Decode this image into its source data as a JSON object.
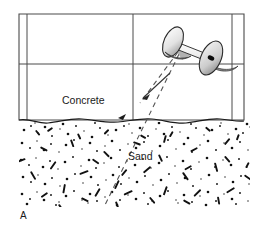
{
  "figure": {
    "panel_label": "A",
    "labels": {
      "concrete": "Concrete",
      "sand": "Sand"
    },
    "colors": {
      "line": "#4a4a4a",
      "outline": "#2b2b2b",
      "text": "#1a1a1a",
      "background": "#ffffff",
      "grain": "#111111",
      "disc_shadow": "#9a9a9a",
      "disc_face": "#ffffff",
      "rod": "#f2f2f2"
    },
    "elements": {
      "concrete_block_name": "concrete-slab",
      "sand_layer_name": "sand-layer",
      "device_name": "dual-antenna-transducer",
      "ray_incident_name": "incident-ray",
      "ray_reflected_name": "reflected-ray",
      "ray_transmitted_name": "transmitted-ray"
    },
    "geometry": {
      "block_left": 19,
      "block_right": 244,
      "block_top": 14,
      "block_bottom": 120,
      "inner_left_line_x": 27,
      "inner_right_line_x": 232,
      "mid_vertical_x": 133,
      "mid_horizontal_y": 64,
      "sand_top": 120,
      "sand_bottom": 207
    }
  },
  "sand_grains": {
    "dots": [
      [
        24,
        130
      ],
      [
        31,
        126
      ],
      [
        38,
        133
      ],
      [
        45,
        127
      ],
      [
        52,
        136
      ],
      [
        60,
        129
      ],
      [
        68,
        134
      ],
      [
        76,
        126
      ],
      [
        84,
        131
      ],
      [
        92,
        137
      ],
      [
        100,
        128
      ],
      [
        108,
        135
      ],
      [
        116,
        130
      ],
      [
        124,
        126
      ],
      [
        132,
        133
      ],
      [
        140,
        128
      ],
      [
        148,
        136
      ],
      [
        156,
        129
      ],
      [
        164,
        134
      ],
      [
        172,
        127
      ],
      [
        180,
        132
      ],
      [
        188,
        138
      ],
      [
        196,
        128
      ],
      [
        204,
        135
      ],
      [
        212,
        130
      ],
      [
        220,
        126
      ],
      [
        228,
        134
      ],
      [
        236,
        129
      ],
      [
        243,
        133
      ],
      [
        250,
        127
      ],
      [
        22,
        143
      ],
      [
        30,
        148
      ],
      [
        37,
        141
      ],
      [
        44,
        150
      ],
      [
        51,
        144
      ],
      [
        59,
        152
      ],
      [
        66,
        145
      ],
      [
        74,
        140
      ],
      [
        82,
        149
      ],
      [
        90,
        143
      ],
      [
        97,
        151
      ],
      [
        105,
        146
      ],
      [
        112,
        141
      ],
      [
        120,
        150
      ],
      [
        128,
        144
      ],
      [
        136,
        148
      ],
      [
        144,
        142
      ],
      [
        152,
        151
      ],
      [
        160,
        146
      ],
      [
        168,
        140
      ],
      [
        176,
        149
      ],
      [
        184,
        144
      ],
      [
        192,
        152
      ],
      [
        200,
        145
      ],
      [
        208,
        141
      ],
      [
        216,
        150
      ],
      [
        224,
        143
      ],
      [
        232,
        148
      ],
      [
        240,
        142
      ],
      [
        248,
        150
      ],
      [
        21,
        160
      ],
      [
        29,
        165
      ],
      [
        36,
        158
      ],
      [
        43,
        167
      ],
      [
        50,
        161
      ],
      [
        58,
        169
      ],
      [
        65,
        162
      ],
      [
        73,
        157
      ],
      [
        81,
        166
      ],
      [
        89,
        160
      ],
      [
        96,
        168
      ],
      [
        104,
        163
      ],
      [
        111,
        158
      ],
      [
        119,
        167
      ],
      [
        127,
        161
      ],
      [
        135,
        165
      ],
      [
        143,
        159
      ],
      [
        151,
        168
      ],
      [
        159,
        163
      ],
      [
        167,
        157
      ],
      [
        175,
        166
      ],
      [
        183,
        161
      ],
      [
        191,
        169
      ],
      [
        199,
        162
      ],
      [
        207,
        158
      ],
      [
        215,
        167
      ],
      [
        223,
        160
      ],
      [
        231,
        165
      ],
      [
        239,
        159
      ],
      [
        247,
        167
      ],
      [
        23,
        177
      ],
      [
        31,
        182
      ],
      [
        38,
        175
      ],
      [
        45,
        184
      ],
      [
        52,
        178
      ],
      [
        60,
        186
      ],
      [
        67,
        179
      ],
      [
        75,
        174
      ],
      [
        83,
        183
      ],
      [
        91,
        177
      ],
      [
        98,
        185
      ],
      [
        106,
        180
      ],
      [
        113,
        175
      ],
      [
        121,
        184
      ],
      [
        129,
        178
      ],
      [
        137,
        182
      ],
      [
        145,
        176
      ],
      [
        153,
        185
      ],
      [
        161,
        180
      ],
      [
        169,
        174
      ],
      [
        177,
        183
      ],
      [
        185,
        178
      ],
      [
        193,
        186
      ],
      [
        201,
        179
      ],
      [
        209,
        175
      ],
      [
        217,
        184
      ],
      [
        225,
        177
      ],
      [
        233,
        182
      ],
      [
        241,
        176
      ],
      [
        249,
        184
      ],
      [
        22,
        194
      ],
      [
        30,
        199
      ],
      [
        37,
        192
      ],
      [
        44,
        200
      ],
      [
        51,
        195
      ],
      [
        59,
        202
      ],
      [
        66,
        196
      ],
      [
        74,
        191
      ],
      [
        82,
        200
      ],
      [
        90,
        194
      ],
      [
        97,
        201
      ],
      [
        105,
        197
      ],
      [
        112,
        192
      ],
      [
        120,
        200
      ],
      [
        128,
        195
      ],
      [
        136,
        199
      ],
      [
        144,
        193
      ],
      [
        152,
        201
      ],
      [
        160,
        196
      ],
      [
        168,
        191
      ],
      [
        176,
        200
      ],
      [
        184,
        195
      ],
      [
        192,
        202
      ],
      [
        200,
        196
      ],
      [
        208,
        192
      ],
      [
        216,
        201
      ],
      [
        224,
        194
      ],
      [
        232,
        199
      ],
      [
        240,
        193
      ],
      [
        248,
        201
      ],
      [
        27,
        204
      ],
      [
        56,
        205
      ],
      [
        88,
        203
      ],
      [
        117,
        205
      ],
      [
        148,
        204
      ],
      [
        178,
        203
      ],
      [
        206,
        205
      ],
      [
        236,
        204
      ],
      [
        35,
        123
      ],
      [
        63,
        124
      ],
      [
        95,
        123
      ],
      [
        129,
        124
      ],
      [
        159,
        123
      ],
      [
        191,
        124
      ],
      [
        221,
        123
      ],
      [
        247,
        124
      ]
    ],
    "streaks": [
      [
        40,
        148,
        5,
        -62
      ],
      [
        55,
        161,
        6,
        35
      ],
      [
        70,
        140,
        5,
        -20
      ],
      [
        88,
        170,
        6,
        70
      ],
      [
        103,
        152,
        5,
        -45
      ],
      [
        118,
        180,
        6,
        25
      ],
      [
        133,
        143,
        5,
        -70
      ],
      [
        150,
        166,
        6,
        50
      ],
      [
        165,
        135,
        5,
        15
      ],
      [
        182,
        173,
        6,
        -35
      ],
      [
        197,
        147,
        5,
        62
      ],
      [
        214,
        163,
        6,
        -15
      ],
      [
        229,
        138,
        5,
        40
      ],
      [
        244,
        176,
        5,
        -55
      ],
      [
        30,
        172,
        6,
        -30
      ],
      [
        47,
        192,
        5,
        55
      ],
      [
        64,
        184,
        6,
        10
      ],
      [
        81,
        199,
        5,
        -65
      ],
      [
        99,
        188,
        6,
        30
      ],
      [
        115,
        202,
        5,
        -20
      ],
      [
        132,
        190,
        6,
        65
      ],
      [
        149,
        198,
        5,
        -40
      ],
      [
        166,
        186,
        6,
        20
      ],
      [
        183,
        201,
        5,
        -60
      ],
      [
        200,
        189,
        6,
        45
      ],
      [
        217,
        197,
        5,
        -10
      ],
      [
        234,
        187,
        6,
        58
      ],
      [
        250,
        198,
        5,
        -48
      ],
      [
        35,
        131,
        4,
        -40
      ],
      [
        52,
        127,
        4,
        55
      ],
      [
        77,
        134,
        4,
        -25
      ],
      [
        108,
        129,
        4,
        45
      ],
      [
        140,
        136,
        4,
        -60
      ],
      [
        172,
        131,
        4,
        30
      ],
      [
        205,
        128,
        4,
        -50
      ],
      [
        238,
        134,
        4,
        20
      ],
      [
        25,
        158,
        5,
        70
      ],
      [
        58,
        205,
        5,
        -35
      ],
      [
        92,
        160,
        5,
        -55
      ],
      [
        126,
        169,
        5,
        40
      ],
      [
        158,
        155,
        5,
        -25
      ],
      [
        191,
        165,
        5,
        60
      ],
      [
        224,
        157,
        5,
        -42
      ],
      [
        248,
        162,
        4,
        28
      ]
    ]
  }
}
